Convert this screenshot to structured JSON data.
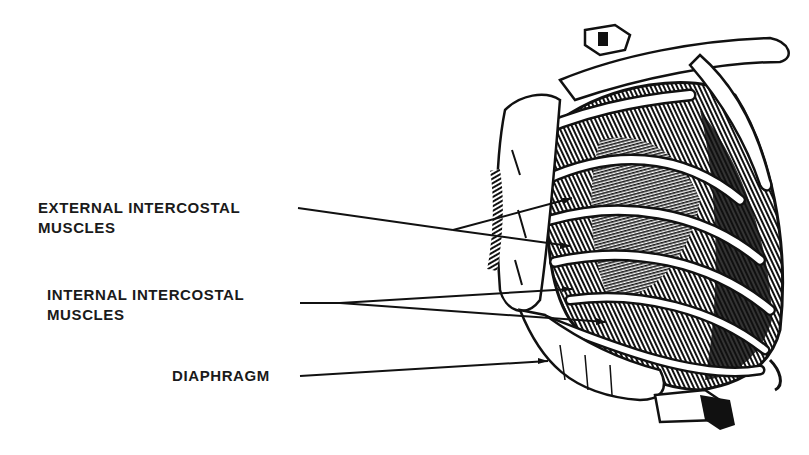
{
  "diagram": {
    "style": "black-and-white anatomical line drawing",
    "colors": {
      "ink": "#111111",
      "paper": "#ffffff",
      "label": "#1a1a1a"
    },
    "labels": [
      {
        "id": "external",
        "line1": "EXTERNAL INTERCOSTAL",
        "line2": "MUSCLES",
        "pointer_targets": 2
      },
      {
        "id": "internal",
        "line1": "INTERNAL INTERCOSTAL",
        "line2": "MUSCLES",
        "pointer_targets": 2
      },
      {
        "id": "diaphragm",
        "line1": "DIAPHRAGM",
        "pointer_targets": 1
      }
    ]
  }
}
